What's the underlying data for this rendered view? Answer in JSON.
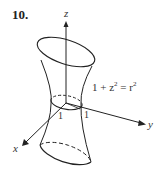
{
  "figure": {
    "number": "10.",
    "equation_lhs": "1 + z",
    "equation_exp": "2",
    "equation_eq": " = r",
    "equation_exp2": "2",
    "axes": {
      "x": "x",
      "y": "y",
      "z": "z"
    },
    "ticks": {
      "x_tick": "1",
      "y_tick": "1"
    },
    "surface": "hyperboloid of one sheet"
  }
}
